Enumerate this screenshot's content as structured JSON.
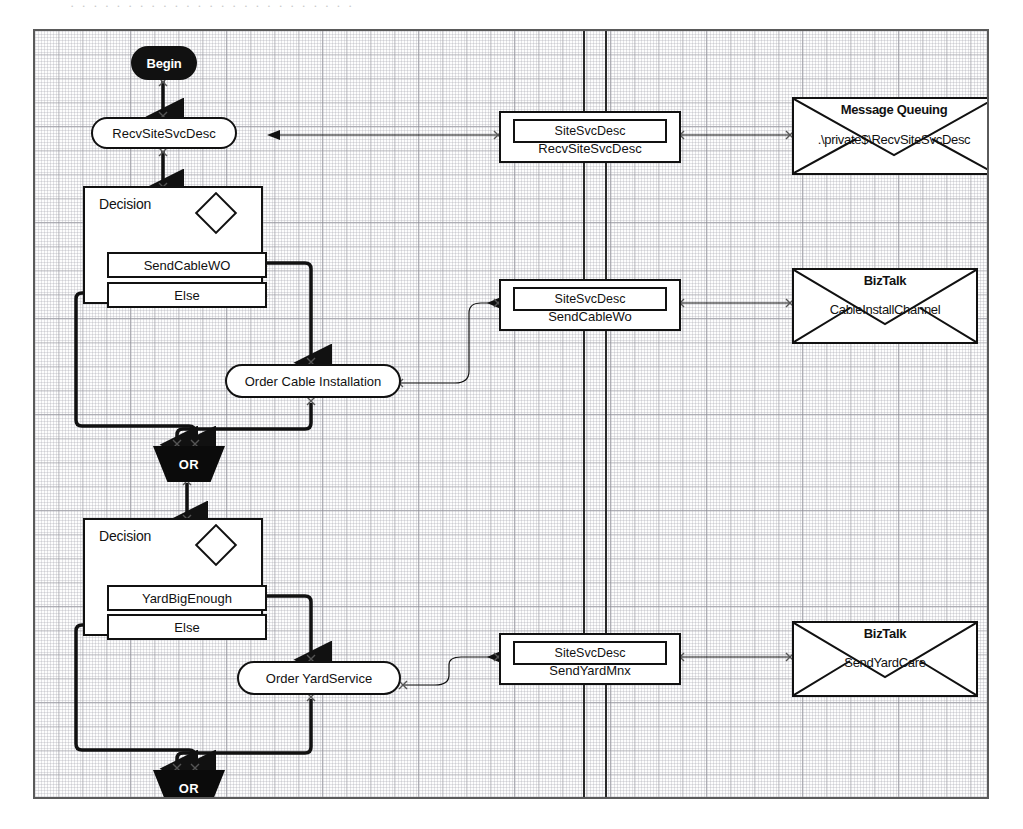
{
  "scan": {
    "top_artifact_text": "· · · · · · · · · · · · · · · · · · · · · · · · ·"
  },
  "diagram": {
    "type": "orchestration-flowchart",
    "title": "",
    "nodes": {
      "begin": {
        "label": "Begin",
        "shape": "terminator"
      },
      "recv_site_svc_desc": {
        "label": "RecvSiteSvcDesc",
        "shape": "activity"
      },
      "decision_cable": {
        "title": "Decision",
        "shape": "decision",
        "branches": [
          {
            "label": "SendCableWO"
          },
          {
            "label": "Else"
          }
        ]
      },
      "order_cable_installation": {
        "label": "Order Cable Installation",
        "shape": "activity"
      },
      "or_join_1": {
        "label": "OR",
        "shape": "or-junction"
      },
      "decision_yard": {
        "title": "Decision",
        "shape": "decision",
        "branches": [
          {
            "label": "YardBigEnough"
          },
          {
            "label": "Else"
          }
        ]
      },
      "order_yard_service": {
        "label": "Order YardService",
        "shape": "activity"
      },
      "or_join_2": {
        "label": "OR",
        "shape": "or-junction"
      }
    },
    "ports": [
      {
        "id": "port_recv",
        "message_type": "SiteSvcDesc",
        "operation": "RecvSiteSvcDesc"
      },
      {
        "id": "port_send_cable",
        "message_type": "SiteSvcDesc",
        "operation": "SendCableWo"
      },
      {
        "id": "port_send_yard",
        "message_type": "SiteSvcDesc",
        "operation": "SendYardMnx"
      }
    ],
    "transports": [
      {
        "id": "transport_msmq",
        "title": "Message Queuing",
        "address": ".\\private$\\RecvSiteSvcDesc"
      },
      {
        "id": "transport_biztalk_cable",
        "title": "BizTalk",
        "address": "CableInstallChannel"
      },
      {
        "id": "transport_biztalk_yard",
        "title": "BizTalk",
        "address": "SendYardCare"
      }
    ],
    "colors": {
      "stroke": "#111111",
      "fill": "#ffffff",
      "solid_node": "#0b0b0b",
      "grid": "#9696a0",
      "frame": "#5a5a5a"
    }
  }
}
